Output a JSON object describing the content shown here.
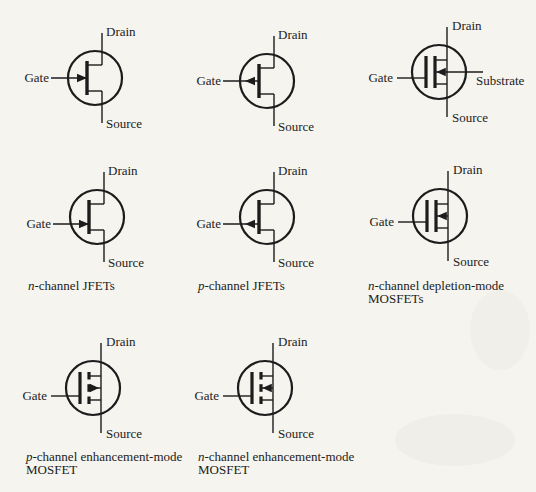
{
  "page": {
    "background": "#f5f4ef",
    "ink": "#1c1c1c",
    "width": 536,
    "height": 492
  },
  "symbols": [
    {
      "id": "n-jfet-centered-gate",
      "type": "jfet",
      "polarity": "n",
      "gate_position": "center",
      "cx": 95,
      "cy": 78,
      "labels": {
        "drain": "Drain",
        "gate": "Gate",
        "source": "Source"
      }
    },
    {
      "id": "p-jfet-centered-gate",
      "type": "jfet",
      "polarity": "p",
      "gate_position": "center",
      "cx": 267,
      "cy": 81,
      "labels": {
        "drain": "Drain",
        "gate": "Gate",
        "source": "Source"
      }
    },
    {
      "id": "n-depletion-mosfet-with-substrate",
      "type": "mosfet-depletion",
      "polarity": "n",
      "gate_position": "source",
      "has_substrate_terminal": true,
      "cx": 439,
      "cy": 72,
      "labels": {
        "drain": "Drain",
        "gate": "Gate",
        "source": "Source",
        "substrate": "Substrate"
      }
    },
    {
      "id": "n-jfet-offset-gate",
      "type": "jfet",
      "polarity": "n",
      "gate_position": "source",
      "cx": 97,
      "cy": 217,
      "labels": {
        "drain": "Drain",
        "gate": "Gate",
        "source": "Source"
      },
      "caption": {
        "x": 28,
        "y": 290,
        "lines": [
          {
            "em": "n",
            "text": "-channel JFETs"
          }
        ]
      }
    },
    {
      "id": "p-jfet-offset-gate",
      "type": "jfet",
      "polarity": "p",
      "gate_position": "source",
      "cx": 267,
      "cy": 217,
      "labels": {
        "drain": "Drain",
        "gate": "Gate",
        "source": "Source"
      },
      "caption": {
        "x": 198,
        "y": 290,
        "lines": [
          {
            "em": "p",
            "text": "-channel JFETs"
          }
        ]
      }
    },
    {
      "id": "n-depletion-mosfet",
      "type": "mosfet-depletion",
      "polarity": "n",
      "gate_position": "source",
      "has_substrate_terminal": false,
      "cx": 440,
      "cy": 216,
      "labels": {
        "drain": "Drain",
        "gate": "Gate",
        "source": "Source"
      },
      "caption": {
        "x": 368,
        "y": 290,
        "lines": [
          {
            "em": "n",
            "text": "-channel depletion-mode"
          },
          {
            "em": "",
            "text": "MOSFETs"
          }
        ]
      }
    },
    {
      "id": "p-enhancement-mosfet",
      "type": "mosfet-enhancement",
      "polarity": "p",
      "gate_position": "source",
      "cx": 93,
      "cy": 388,
      "labels": {
        "drain": "Drain",
        "gate": "Gate",
        "source": "Source"
      },
      "caption": {
        "x": 26,
        "y": 461,
        "lines": [
          {
            "em": "p",
            "text": "-channel enhancement-mode"
          },
          {
            "em": "",
            "text": "MOSFET"
          }
        ]
      }
    },
    {
      "id": "n-enhancement-mosfet",
      "type": "mosfet-enhancement",
      "polarity": "n",
      "gate_position": "source",
      "cx": 265,
      "cy": 388,
      "labels": {
        "drain": "Drain",
        "gate": "Gate",
        "source": "Source"
      },
      "caption": {
        "x": 198,
        "y": 461,
        "lines": [
          {
            "em": "n",
            "text": "-channel enhancement-mode"
          },
          {
            "em": "",
            "text": "MOSFET"
          }
        ]
      }
    }
  ]
}
